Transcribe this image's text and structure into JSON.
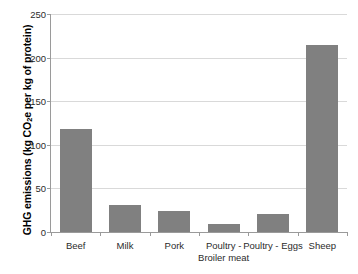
{
  "chart_data": {
    "type": "bar",
    "title": "",
    "xlabel": "",
    "ylabel": "GHG emissions (kg CO2e per kg of protein)",
    "ylabel_parts": {
      "before": "GHG emissions (kg CO",
      "subscript": "2",
      "after": "e per kg of protein)"
    },
    "categories": [
      "Beef",
      "Milk",
      "Pork",
      "Poultry -\nBroiler meat",
      "Poultry - Eggs",
      "Sheep"
    ],
    "values": [
      118,
      31,
      24,
      9,
      21,
      215
    ],
    "ylim": [
      0,
      250
    ],
    "yticks": [
      0,
      50,
      100,
      150,
      200,
      250
    ],
    "ytick_labels": [
      "0",
      "50",
      "100",
      "150",
      "200",
      "250"
    ],
    "grid": true,
    "legend": "none",
    "bar_color": "#808080",
    "gridline_color": "#d9d9d9",
    "axis_color": "#9a9a9a",
    "background_color": "#ffffff"
  }
}
